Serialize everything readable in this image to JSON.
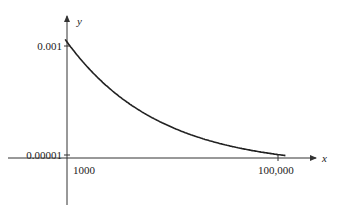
{
  "chart_data": {
    "type": "line",
    "title": "",
    "xlabel": "x",
    "ylabel": "y",
    "x_ticks": [
      {
        "value": 1000,
        "label": "1000"
      },
      {
        "value": 100000,
        "label": "100,000"
      }
    ],
    "y_ticks": [
      {
        "value": 0.001,
        "label": "0.001"
      },
      {
        "value": 1e-05,
        "label": "0.00001"
      }
    ],
    "xlim": [
      0,
      110000
    ],
    "ylim": [
      0,
      0.0011
    ],
    "grid": false,
    "series": [
      {
        "name": "y = 1/x",
        "x": [
          900,
          1000,
          1200,
          1500,
          2000,
          3000,
          5000,
          8000,
          12000,
          20000,
          35000,
          60000,
          100000,
          110000
        ],
        "y": [
          0.00111,
          0.001,
          0.000833,
          0.000667,
          0.0005,
          0.000333,
          0.0002,
          0.000125,
          8.33e-05,
          5e-05,
          2.86e-05,
          1.67e-05,
          1e-05,
          9.1e-06
        ]
      }
    ],
    "colors": {
      "curve": "#222222",
      "axes": "#333333"
    }
  }
}
